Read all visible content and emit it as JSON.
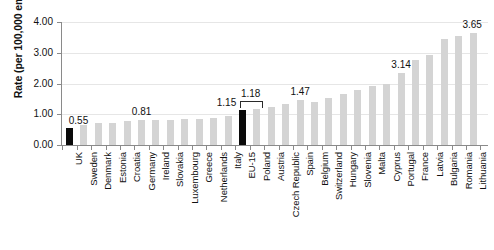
{
  "chart_data": {
    "type": "bar",
    "title": "",
    "xlabel": "",
    "ylabel": "Rate (per 100,000 employees)",
    "ylim": [
      0,
      4.0
    ],
    "ytick_labels": [
      "0.00",
      "1.00",
      "2.00",
      "3.00",
      "4.00"
    ],
    "ytick_values": [
      0,
      1,
      2,
      3,
      4
    ],
    "grid": true,
    "legend": "none",
    "highlight_color": "#0a0a0a",
    "bar_color": "#d4d4d4",
    "categories": [
      "UK",
      "Sweden",
      "Denmark",
      "Estonia",
      "Croatia",
      "Germany",
      "Ireland",
      "Slovakia",
      "Luxembourg",
      "Greece",
      "Netherlands",
      "Italy",
      "EU-15",
      "Poland",
      "Austria",
      "Czech Republic",
      "Spain",
      "Belgium",
      "Switzerland",
      "Hungary",
      "Slovenia",
      "Malta",
      "Cyprus",
      "Portugal",
      "France",
      "Latvia",
      "Bulgaria",
      "Romania",
      "Lithuania"
    ],
    "values": [
      0.55,
      0.65,
      0.7,
      0.73,
      0.77,
      0.81,
      0.81,
      0.82,
      0.83,
      0.85,
      0.88,
      0.95,
      1.15,
      1.18,
      1.25,
      1.32,
      1.47,
      1.4,
      1.52,
      1.65,
      1.78,
      1.92,
      1.98,
      2.35,
      2.75,
      2.92,
      3.45,
      3.55,
      3.65
    ],
    "highlighted": [
      "UK",
      "EU-15"
    ],
    "data_labels": [
      {
        "category": "UK",
        "text": "0.55"
      },
      {
        "category": "Germany",
        "text": "0.81"
      },
      {
        "category": "EU-15",
        "text": "1.15"
      },
      {
        "category": "Poland",
        "text": "1.18"
      },
      {
        "category": "Spain",
        "text": "1.47"
      },
      {
        "category": "Portugal",
        "text": "3.14"
      },
      {
        "category": "Lithuania",
        "text": "3.65"
      }
    ],
    "bracket": {
      "from": "EU-15",
      "to": "Poland",
      "label": "1.18"
    }
  }
}
